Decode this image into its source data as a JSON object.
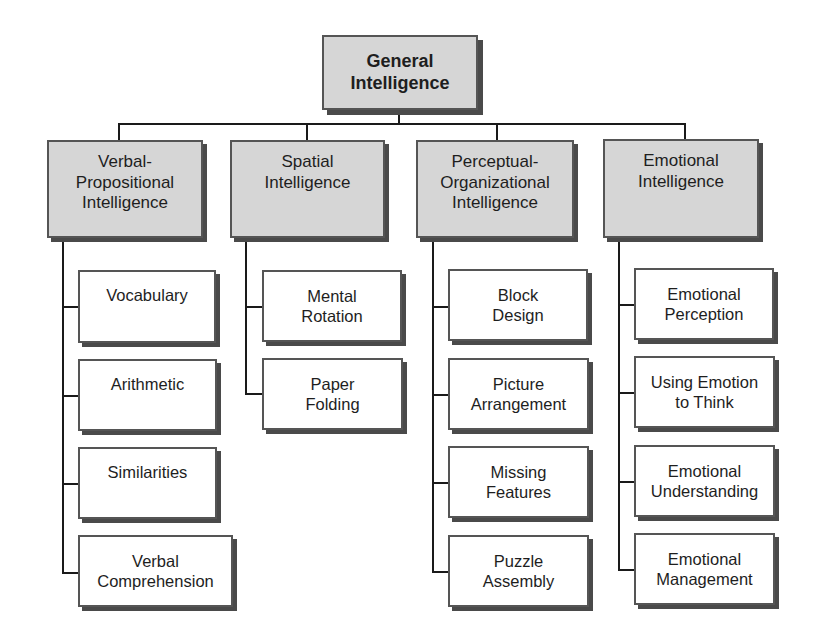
{
  "root": {
    "label_lines": [
      "General",
      "Intelligence"
    ]
  },
  "categories": [
    {
      "id": "verbal-propositional",
      "label_lines": [
        "Verbal-",
        "Propositional",
        "Intelligence"
      ],
      "children": [
        {
          "label_lines": [
            "Vocabulary"
          ]
        },
        {
          "label_lines": [
            "Arithmetic"
          ]
        },
        {
          "label_lines": [
            "Similarities"
          ]
        },
        {
          "label_lines": [
            "Verbal",
            "Comprehension"
          ]
        }
      ]
    },
    {
      "id": "spatial",
      "label_lines": [
        "Spatial",
        "Intelligence"
      ],
      "children": [
        {
          "label_lines": [
            "Mental",
            "Rotation"
          ]
        },
        {
          "label_lines": [
            "Paper",
            "Folding"
          ]
        }
      ]
    },
    {
      "id": "perceptual-organizational",
      "label_lines": [
        "Perceptual-",
        "Organizational",
        "Intelligence"
      ],
      "children": [
        {
          "label_lines": [
            "Block",
            "Design"
          ]
        },
        {
          "label_lines": [
            "Picture",
            "Arrangement"
          ]
        },
        {
          "label_lines": [
            "Missing",
            "Features"
          ]
        },
        {
          "label_lines": [
            "Puzzle",
            "Assembly"
          ]
        }
      ]
    },
    {
      "id": "emotional",
      "label_lines": [
        "Emotional",
        "Intelligence"
      ],
      "children": [
        {
          "label_lines": [
            "Emotional",
            "Perception"
          ]
        },
        {
          "label_lines": [
            "Using Emotion",
            "to Think"
          ]
        },
        {
          "label_lines": [
            "Emotional",
            "Understanding"
          ]
        },
        {
          "label_lines": [
            "Emotional",
            "Management"
          ]
        }
      ]
    }
  ],
  "colors": {
    "category_fill": "#d6d6d6",
    "leaf_fill": "#ffffff",
    "border": "#555555",
    "shadow": "#4a4a4a",
    "connector": "#1a1a1a"
  }
}
